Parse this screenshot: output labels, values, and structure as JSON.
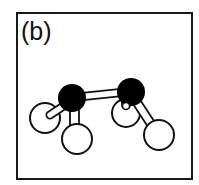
{
  "figure": {
    "panel_label": "(b)",
    "colors": {
      "frame": "#1a1a1a",
      "dark_atom": "#000000",
      "light_atom_fill": "#ffffff",
      "outline": "#111111"
    },
    "atoms": [
      {
        "id": "dark-left",
        "type": "dark",
        "cx": 72,
        "cy": 98,
        "r": 14
      },
      {
        "id": "dark-right",
        "type": "dark",
        "cx": 131,
        "cy": 92,
        "r": 14
      },
      {
        "id": "light-far-left",
        "type": "light",
        "cx": 45,
        "cy": 118,
        "r": 15
      },
      {
        "id": "light-lower-left",
        "type": "light",
        "cx": 77,
        "cy": 139,
        "r": 15
      },
      {
        "id": "light-middle-right",
        "type": "light",
        "cx": 126,
        "cy": 113,
        "r": 14
      },
      {
        "id": "light-far-right",
        "type": "light",
        "cx": 159,
        "cy": 135,
        "r": 15
      }
    ],
    "bonds": [
      {
        "from": "dark-left",
        "to": "dark-right"
      },
      {
        "from": "dark-left",
        "to": "light-far-left"
      },
      {
        "from": "dark-left",
        "to": "light-lower-left"
      },
      {
        "from": "dark-right",
        "to": "light-middle-right"
      },
      {
        "from": "dark-right",
        "to": "light-far-right"
      }
    ]
  }
}
